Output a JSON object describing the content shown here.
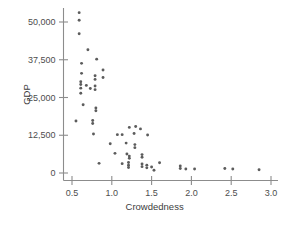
{
  "figure": {
    "background": "#ffffff",
    "marker_color": "#5c5c5c",
    "axis_color": "#8c8c8c",
    "text_color": "#4d4d4d"
  },
  "chart_data": {
    "type": "scatter",
    "title": "",
    "xlabel": "Crowdedness",
    "ylabel": "GDP",
    "xlim": [
      0.38,
      3.06
    ],
    "ylim": [
      -1800,
      54500
    ],
    "grid": false,
    "legend": null,
    "xticks": [
      0.5,
      1.0,
      1.5,
      2.0,
      2.5,
      3.0
    ],
    "xtick_labels": [
      "0.5",
      "1.0",
      "1.5",
      "2.0",
      "2.5",
      "3.0"
    ],
    "yticks": [
      0,
      12500,
      25000,
      37500,
      50000
    ],
    "ytick_labels": [
      "0",
      "12,500",
      "25,000",
      "37,500",
      "50,000"
    ],
    "points": [
      [
        0.59,
        53100
      ],
      [
        0.59,
        50600
      ],
      [
        0.59,
        46100
      ],
      [
        0.7,
        40800
      ],
      [
        0.81,
        37700
      ],
      [
        0.62,
        36300
      ],
      [
        0.89,
        34100
      ],
      [
        0.62,
        33000
      ],
      [
        0.79,
        32200
      ],
      [
        0.89,
        31600
      ],
      [
        0.79,
        31000
      ],
      [
        0.61,
        30200
      ],
      [
        0.61,
        29300
      ],
      [
        0.68,
        29000
      ],
      [
        0.79,
        28800
      ],
      [
        0.61,
        28100
      ],
      [
        0.73,
        28000
      ],
      [
        0.79,
        27600
      ],
      [
        0.61,
        26400
      ],
      [
        0.64,
        22600
      ],
      [
        0.8,
        21500
      ],
      [
        0.8,
        20600
      ],
      [
        0.55,
        17200
      ],
      [
        0.76,
        17400
      ],
      [
        0.76,
        16400
      ],
      [
        1.22,
        15100
      ],
      [
        1.3,
        15400
      ],
      [
        1.36,
        14600
      ],
      [
        0.77,
        12900
      ],
      [
        1.07,
        12700
      ],
      [
        1.13,
        12700
      ],
      [
        1.28,
        13100
      ],
      [
        1.45,
        12600
      ],
      [
        0.98,
        9700
      ],
      [
        1.18,
        9900
      ],
      [
        1.29,
        9400
      ],
      [
        1.29,
        8400
      ],
      [
        1.04,
        6500
      ],
      [
        1.19,
        6300
      ],
      [
        1.22,
        5600
      ],
      [
        1.22,
        4900
      ],
      [
        1.38,
        6100
      ],
      [
        1.38,
        5200
      ],
      [
        0.84,
        3200
      ],
      [
        1.13,
        3100
      ],
      [
        1.21,
        3500
      ],
      [
        1.21,
        2600
      ],
      [
        1.21,
        1800
      ],
      [
        1.38,
        3000
      ],
      [
        1.38,
        2100
      ],
      [
        1.44,
        2600
      ],
      [
        1.44,
        1700
      ],
      [
        1.5,
        2000
      ],
      [
        1.53,
        900
      ],
      [
        1.6,
        3400
      ],
      [
        1.86,
        2300
      ],
      [
        1.86,
        1500
      ],
      [
        1.93,
        1300
      ],
      [
        2.04,
        1300
      ],
      [
        2.42,
        1500
      ],
      [
        2.52,
        1300
      ],
      [
        2.85,
        1100
      ]
    ]
  }
}
